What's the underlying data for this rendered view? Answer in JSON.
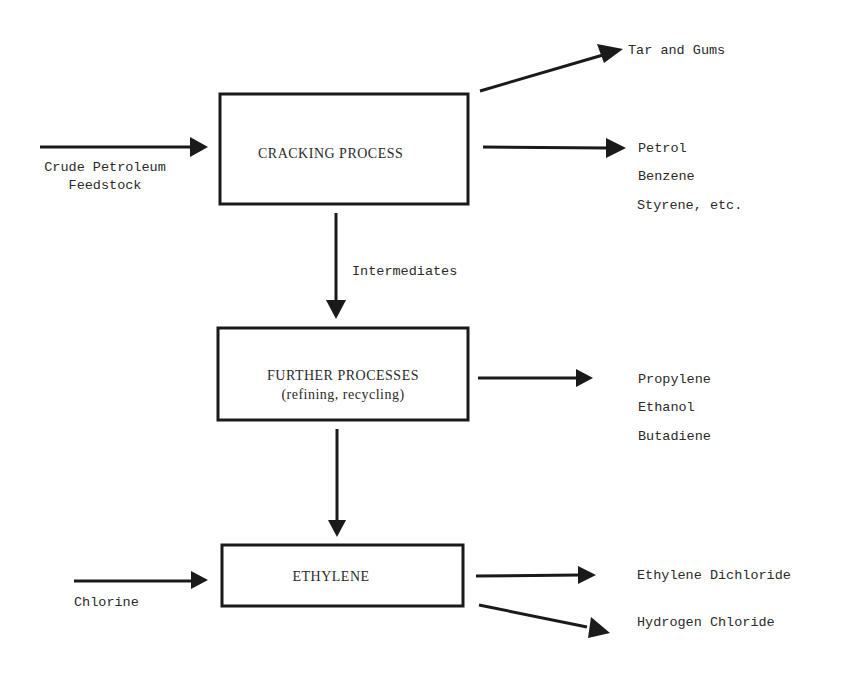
{
  "diagram": {
    "title": "",
    "nodes": {
      "cracking": {
        "label": "CRACKING PROCESS"
      },
      "further": {
        "label_line1": "FURTHER PROCESSES",
        "label_line2": "(refining, recycling)"
      },
      "ethylene": {
        "label": "ETHYLENE"
      }
    },
    "inputs": {
      "crude": {
        "line1": "Crude Petroleum",
        "line2": "Feedstock"
      },
      "chlorine": {
        "label": "Chlorine"
      }
    },
    "edge_labels": {
      "intermediates": "Intermediates"
    },
    "outputs": {
      "tar": [
        "Tar and Gums"
      ],
      "cracking_products": [
        "Petrol",
        "Benzene",
        "Styrene, etc."
      ],
      "further_products": [
        "Propylene",
        "Ethanol",
        "Butadiene"
      ],
      "ethylene_products": [
        "Ethylene Dichloride",
        "Hydrogen Chloride"
      ]
    },
    "edges": [
      {
        "from": "Crude Petroleum Feedstock",
        "to": "CRACKING PROCESS"
      },
      {
        "from": "CRACKING PROCESS",
        "to": "Tar and Gums"
      },
      {
        "from": "CRACKING PROCESS",
        "to": "Petrol / Benzene / Styrene, etc."
      },
      {
        "from": "CRACKING PROCESS",
        "to": "FURTHER PROCESSES",
        "label": "Intermediates"
      },
      {
        "from": "FURTHER PROCESSES",
        "to": "Propylene / Ethanol / Butadiene"
      },
      {
        "from": "FURTHER PROCESSES",
        "to": "ETHYLENE"
      },
      {
        "from": "Chlorine",
        "to": "ETHYLENE"
      },
      {
        "from": "ETHYLENE",
        "to": "Ethylene Dichloride"
      },
      {
        "from": "ETHYLENE",
        "to": "Hydrogen Chloride"
      }
    ]
  }
}
